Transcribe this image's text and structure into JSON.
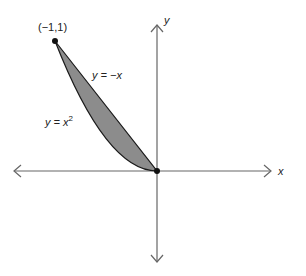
{
  "diagram": {
    "axes": {
      "x_label": "x",
      "y_label": "y"
    },
    "point_label": "(−1,1)",
    "curve_upper_label": "y = −x",
    "curve_lower_label_base": "y = x",
    "curve_lower_label_exp": "2",
    "colors": {
      "fill": "#8c8c8c",
      "stroke": "#1a1a1a",
      "axis": "#555555"
    }
  }
}
